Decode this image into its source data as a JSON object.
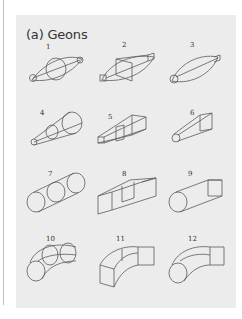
{
  "figure": {
    "title": "(a) Geons",
    "geons": [
      {
        "id": 1,
        "label": "1",
        "shape": "curved-sides elliptical cross-section expanding-contracting (lemon)"
      },
      {
        "id": 2,
        "label": "2",
        "shape": "straight-edged cross-section expanding-contracting"
      },
      {
        "id": 3,
        "label": "3",
        "shape": "curved cross-section expanding-contracting, asymmetric"
      },
      {
        "id": 4,
        "label": "4",
        "shape": "cone (expanding round cross-section)"
      },
      {
        "id": 5,
        "label": "5",
        "shape": "expanding square cross-section (truncated pyramid)"
      },
      {
        "id": 6,
        "label": "6",
        "shape": "expanding, round to square"
      },
      {
        "id": 7,
        "label": "7",
        "shape": "cylinder"
      },
      {
        "id": 8,
        "label": "8",
        "shape": "brick (rectangular prism)"
      },
      {
        "id": 9,
        "label": "9",
        "shape": "round end to square end, constant"
      },
      {
        "id": 10,
        "label": "10",
        "shape": "curved cylinder"
      },
      {
        "id": 11,
        "label": "11",
        "shape": "curved brick"
      },
      {
        "id": 12,
        "label": "12",
        "shape": "curved, round to square"
      }
    ]
  },
  "colors": {
    "panel_bg": "#ececec",
    "line": "#5a5a5a",
    "text": "#333333"
  }
}
